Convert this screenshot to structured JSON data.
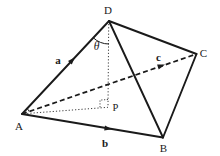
{
  "diagram": {
    "figure_type": "geometry-vector-diagram",
    "colors": {
      "ink": "#1a1a1a",
      "background": "#ffffff"
    },
    "vertex_labels": {
      "A": "A",
      "B": "B",
      "C": "C",
      "D": "D",
      "P": "P"
    },
    "vector_labels": {
      "a": "a",
      "b": "b",
      "c": "c"
    },
    "angle_label": "θ"
  }
}
